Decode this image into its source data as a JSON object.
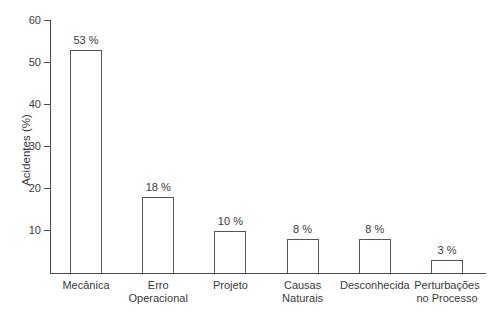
{
  "chart_data": {
    "type": "bar",
    "title": "",
    "xlabel": "",
    "ylabel": "Acidentes (%)",
    "ylim": [
      0,
      60
    ],
    "yticks": [
      10,
      20,
      30,
      40,
      50,
      60
    ],
    "categories": [
      "Mecânica",
      "Erro\nOperacional",
      "Projeto",
      "Causas\nNaturais",
      "Desconhecida",
      "Perturbações\nno Processo"
    ],
    "slugs": [
      "mecanica",
      "erro-operacional",
      "projeto",
      "causas-naturais",
      "desconhecida",
      "perturbacoes-no-processo"
    ],
    "values": [
      53,
      18,
      10,
      8,
      8,
      3
    ],
    "value_labels": [
      "53 %",
      "18 %",
      "10 %",
      "8 %",
      "8 %",
      "3 %"
    ],
    "grid": false,
    "legend": "none",
    "bar_fill": "#ffffff",
    "bar_border": "#555555",
    "axis_color": "#4a4a4a",
    "text_color": "#3a3a3a",
    "background": "#ffffff"
  }
}
